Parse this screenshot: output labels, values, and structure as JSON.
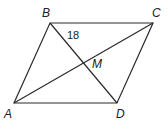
{
  "diagram": {
    "shape": "parallelogram",
    "vertices": {
      "A": {
        "label": "A",
        "x": 14,
        "y": 103
      },
      "B": {
        "label": "B",
        "x": 50,
        "y": 23
      },
      "C": {
        "label": "C",
        "x": 153,
        "y": 23
      },
      "D": {
        "label": "D",
        "x": 117,
        "y": 103
      }
    },
    "intersection": {
      "label": "M"
    },
    "segment_label": {
      "text": "18",
      "segment": "BM"
    },
    "stroke_color": "#2a2a2a"
  }
}
